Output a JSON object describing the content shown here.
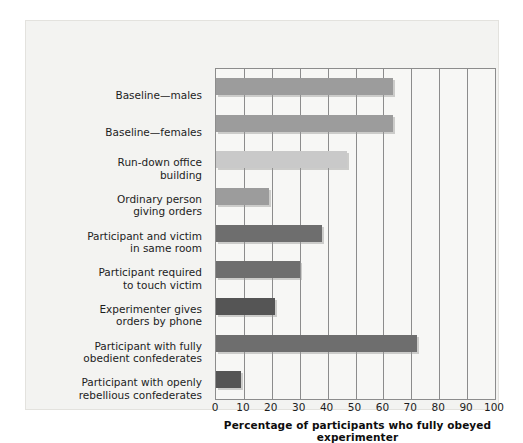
{
  "chart_data": {
    "type": "bar",
    "orientation": "horizontal",
    "title": "",
    "xlabel": "Percentage of participants who fully obeyed experimenter",
    "ylabel": "",
    "xlim": [
      0,
      100
    ],
    "xticks": [
      0,
      10,
      20,
      30,
      40,
      50,
      60,
      70,
      80,
      90,
      100
    ],
    "grid": true,
    "legend": "none",
    "categories": [
      "Baseline—males",
      "Baseline—females",
      "Run-down office building",
      "Ordinary person giving orders",
      "Participant and victim in same room",
      "Participant required to touch victim",
      "Experimenter gives orders by phone",
      "Participant with fully obedient confederates",
      "Participant with openly rebellious confederates"
    ],
    "category_lines": [
      [
        "Baseline—males"
      ],
      [
        "Baseline—females"
      ],
      [
        "Run-down office",
        "building"
      ],
      [
        "Ordinary person",
        "giving orders"
      ],
      [
        "Participant and victim",
        "in same room"
      ],
      [
        "Participant required",
        "to touch victim"
      ],
      [
        "Experimenter gives",
        "orders by phone"
      ],
      [
        "Participant with fully",
        "obedient confederates"
      ],
      [
        "Participant with openly",
        "rebellious confederates"
      ]
    ],
    "values": [
      63.5,
      63.5,
      47,
      19,
      38,
      30,
      21,
      72,
      9
    ],
    "bar_colors": [
      "#9c9c9c",
      "#9c9c9c",
      "#c9c9c9",
      "#9c9c9c",
      "#6e6e6e",
      "#6e6e6e",
      "#555555",
      "#6e6e6e",
      "#555555"
    ]
  },
  "figure": {
    "background": "#f3f3f1",
    "plot_background": "#f7f7f5",
    "axis_color": "#8c8c8c"
  }
}
